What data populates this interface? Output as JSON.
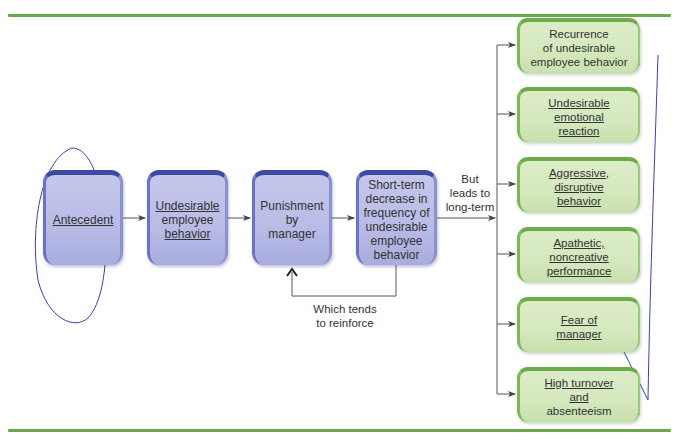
{
  "colors": {
    "rule": "#6aa84f",
    "blue_box_fill": "#b8bbe5",
    "blue_box_border": "#3b4aa2",
    "green_box_fill": "#d4e8bd",
    "green_box_border": "#6bab48",
    "connector": "#555555",
    "annotation_ink": "#3a3fb0"
  },
  "process": {
    "boxes": [
      {
        "id": "antecedent",
        "lines": [
          "Antecedent"
        ]
      },
      {
        "id": "undesirable-behavior",
        "lines": [
          "Undesirable",
          "employee",
          "behavior"
        ]
      },
      {
        "id": "punishment",
        "lines": [
          "Punishment",
          "by",
          "manager"
        ]
      },
      {
        "id": "short-term-decrease",
        "lines": [
          "Short-term",
          "decrease in",
          "frequency of",
          "undesirable",
          "employee",
          "behavior"
        ]
      }
    ],
    "feedback_label": [
      "Which tends",
      "to reinforce"
    ],
    "branch_label": [
      "But",
      "leads to",
      "long-term"
    ]
  },
  "outcomes": [
    {
      "id": "recurrence",
      "lines": [
        "Recurrence",
        "of undesirable",
        "employee behavior"
      ]
    },
    {
      "id": "emotional-reaction",
      "lines": [
        "Undesirable",
        "emotional",
        "reaction"
      ]
    },
    {
      "id": "aggressive",
      "lines": [
        "Aggressive,",
        "disruptive",
        "behavior"
      ]
    },
    {
      "id": "apathetic",
      "lines": [
        "Apathetic,",
        "noncreative",
        "performance"
      ]
    },
    {
      "id": "fear",
      "lines": [
        "Fear of",
        "manager"
      ]
    },
    {
      "id": "turnover",
      "lines": [
        "High turnover",
        "and",
        "absenteeism"
      ]
    }
  ]
}
